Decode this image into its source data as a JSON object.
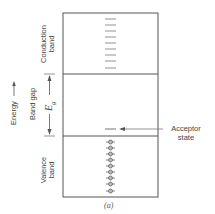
{
  "diagram": {
    "caption": "(a)",
    "axis_label": "Energy",
    "bands": {
      "conduction": {
        "label_line1": "Conduction",
        "label_line2": "band",
        "empty_levels": 9
      },
      "gap": {
        "label": "Band gap",
        "symbol": "E",
        "symbol_sub": "g"
      },
      "valence": {
        "label_line1": "Valence",
        "label_line2": "band",
        "filled_levels": 9
      }
    },
    "acceptor": {
      "label_line1": "Acceptor",
      "label_line2": "state"
    },
    "colors": {
      "line": "#555555",
      "text": "#444444",
      "background": "#ffffff"
    }
  }
}
